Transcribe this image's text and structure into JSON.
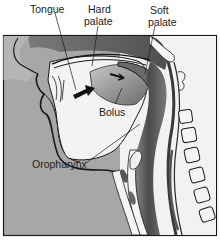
{
  "figure": {
    "labels": {
      "tongue": "Tongue",
      "hard_palate_line1": "Hard",
      "hard_palate_line2": "palate",
      "soft_palate_line1": "Soft",
      "soft_palate_line2": "palate",
      "bolus": "Bolus",
      "oropharynx": "Oropharynx"
    },
    "colors": {
      "background": "#ffffff",
      "skin_gray": "#a9a9a9",
      "dark_tissue": "#5e5e5e",
      "mid_tissue": "#8a8a8a",
      "outline": "#1a1a1a",
      "light_tissue": "#f4f4f4"
    }
  }
}
